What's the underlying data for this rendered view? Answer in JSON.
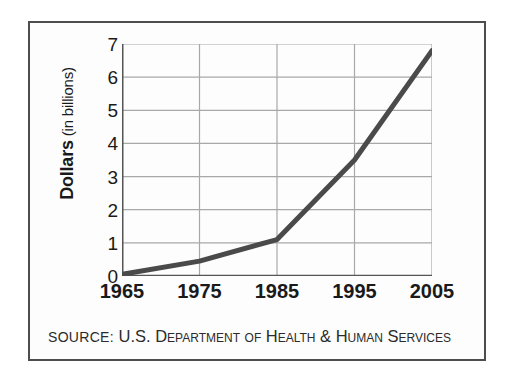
{
  "figure": {
    "source_prefix": "SOURCE:",
    "source_body": " U.S. Department of Health & Human Services",
    "y_axis_title_strong": "Dollars",
    "y_axis_title_light": " (in billions)"
  },
  "colors": {
    "frame": "#4d4d4d",
    "grid": "#a8a8a8",
    "axis": "#555555",
    "series_line": "#4a4a4a",
    "text": "#1a1a1a",
    "background": "#fdfdfd"
  },
  "chart_data": {
    "type": "line",
    "title": "",
    "subtitle": "",
    "xlabel": "",
    "ylabel": "Dollars (in billions)",
    "x": [
      1965,
      1975,
      1985,
      1995,
      2005
    ],
    "categories": [
      "1965",
      "1975",
      "1985",
      "1995",
      "2005"
    ],
    "values": [
      0.05,
      0.45,
      1.1,
      3.5,
      6.8
    ],
    "series": [
      {
        "name": "Dollars (in billions)",
        "values": [
          0.05,
          0.45,
          1.1,
          3.5,
          6.8
        ]
      }
    ],
    "xlim": [
      1965,
      2005
    ],
    "ylim": [
      0,
      7
    ],
    "ytick_labels": [
      "0",
      "1",
      "2",
      "3",
      "4",
      "5",
      "6",
      "7"
    ],
    "ytick_values": [
      0,
      1,
      2,
      3,
      4,
      5,
      6,
      7
    ],
    "xtick_labels": [
      "1965",
      "1975",
      "1985",
      "1995",
      "2005"
    ],
    "xtick_values": [
      1965,
      1975,
      1985,
      1995,
      2005
    ],
    "grid": true,
    "legend": false,
    "legend_position": "none",
    "annotations": [
      "SOURCE: U.S. Department of Health & Human Services"
    ]
  }
}
